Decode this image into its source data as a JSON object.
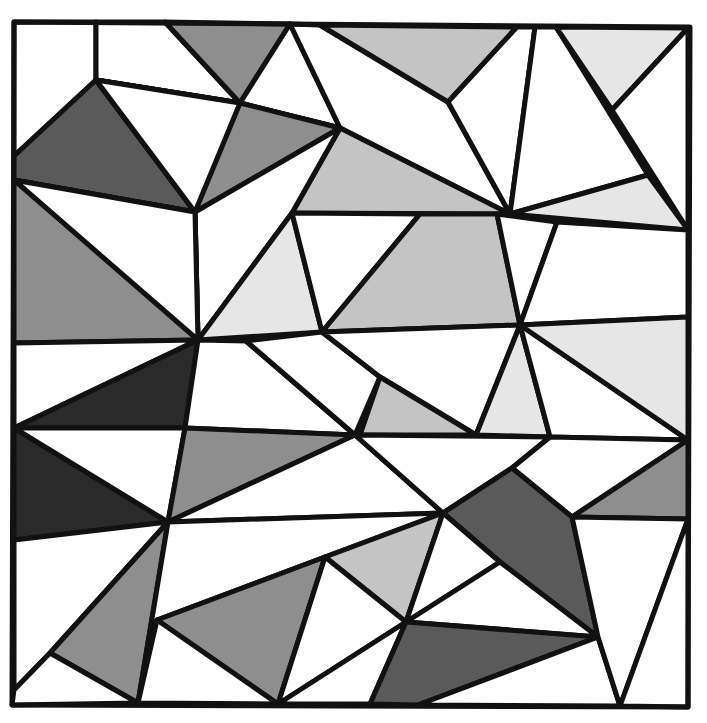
{
  "artwork": {
    "type": "geometric-polygon-mosaic",
    "palette": {
      "white": "#ffffff",
      "light": "#e6e6e6",
      "lightmid": "#c4c4c4",
      "mid": "#8e8e8e",
      "dark": "#5a5a5a",
      "darkest": "#2a2a2a",
      "stroke": "#111111"
    },
    "frame": [
      [
        14,
        22
      ],
      [
        690,
        27
      ],
      [
        688,
        707
      ],
      [
        12,
        705
      ]
    ],
    "polygons": [
      {
        "shade": "white",
        "points": [
          [
            14,
            22
          ],
          [
            96,
            22
          ],
          [
            96,
            80
          ],
          [
            14,
            156
          ]
        ]
      },
      {
        "shade": "white",
        "points": [
          [
            96,
            22
          ],
          [
            165,
            22
          ],
          [
            240,
            103
          ],
          [
            96,
            80
          ]
        ]
      },
      {
        "shade": "mid",
        "points": [
          [
            165,
            22
          ],
          [
            290,
            24
          ],
          [
            240,
            103
          ]
        ]
      },
      {
        "shade": "white",
        "points": [
          [
            290,
            24
          ],
          [
            340,
            128
          ],
          [
            240,
            103
          ]
        ]
      },
      {
        "shade": "white",
        "points": [
          [
            290,
            24
          ],
          [
            320,
            25
          ],
          [
            448,
            102
          ],
          [
            510,
            214
          ],
          [
            340,
            128
          ]
        ]
      },
      {
        "shade": "lightmid",
        "points": [
          [
            320,
            25
          ],
          [
            517,
            27
          ],
          [
            448,
            102
          ]
        ]
      },
      {
        "shade": "white",
        "points": [
          [
            517,
            27
          ],
          [
            535,
            27
          ],
          [
            510,
            214
          ],
          [
            448,
            102
          ]
        ]
      },
      {
        "shade": "white",
        "points": [
          [
            535,
            27
          ],
          [
            556,
            27
          ],
          [
            648,
            175
          ],
          [
            510,
            214
          ]
        ]
      },
      {
        "shade": "light",
        "points": [
          [
            556,
            27
          ],
          [
            688,
            28
          ],
          [
            612,
            110
          ]
        ]
      },
      {
        "shade": "white",
        "points": [
          [
            688,
            28
          ],
          [
            688,
            230
          ],
          [
            612,
            110
          ]
        ]
      },
      {
        "shade": "light",
        "points": [
          [
            648,
            175
          ],
          [
            688,
            230
          ],
          [
            510,
            214
          ]
        ]
      },
      {
        "shade": "dark",
        "points": [
          [
            14,
            156
          ],
          [
            96,
            80
          ],
          [
            195,
            212
          ],
          [
            14,
            180
          ]
        ]
      },
      {
        "shade": "white",
        "points": [
          [
            96,
            80
          ],
          [
            240,
            103
          ],
          [
            195,
            212
          ]
        ]
      },
      {
        "shade": "white",
        "points": [
          [
            96,
            80
          ],
          [
            240,
            103
          ],
          [
            195,
            212
          ]
        ]
      },
      {
        "shade": "white",
        "points": [
          [
            96,
            80
          ],
          [
            240,
            103
          ],
          [
            340,
            128
          ],
          [
            195,
            212
          ]
        ]
      },
      {
        "shade": "mid",
        "points": [
          [
            240,
            103
          ],
          [
            340,
            128
          ],
          [
            195,
            212
          ]
        ]
      },
      {
        "shade": "lightmid",
        "points": [
          [
            340,
            128
          ],
          [
            510,
            214
          ],
          [
            292,
            213
          ]
        ]
      },
      {
        "shade": "white",
        "points": [
          [
            340,
            128
          ],
          [
            292,
            213
          ],
          [
            198,
            340
          ],
          [
            195,
            212
          ]
        ]
      },
      {
        "shade": "mid",
        "points": [
          [
            14,
            180
          ],
          [
            195,
            212
          ],
          [
            198,
            340
          ],
          [
            14,
            343
          ]
        ]
      },
      {
        "shade": "white",
        "points": [
          [
            14,
            180
          ],
          [
            195,
            212
          ],
          [
            198,
            340
          ]
        ]
      },
      {
        "shade": "light",
        "points": [
          [
            292,
            213
          ],
          [
            322,
            332
          ],
          [
            198,
            340
          ]
        ]
      },
      {
        "shade": "white",
        "points": [
          [
            292,
            213
          ],
          [
            420,
            214
          ],
          [
            322,
            332
          ]
        ]
      },
      {
        "shade": "lightmid",
        "points": [
          [
            420,
            214
          ],
          [
            497,
            214
          ],
          [
            520,
            325
          ],
          [
            322,
            332
          ]
        ]
      },
      {
        "shade": "white",
        "points": [
          [
            497,
            214
          ],
          [
            557,
            222
          ],
          [
            520,
            325
          ]
        ]
      },
      {
        "shade": "white",
        "points": [
          [
            557,
            222
          ],
          [
            688,
            230
          ],
          [
            688,
            317
          ],
          [
            520,
            325
          ]
        ]
      },
      {
        "shade": "white",
        "points": [
          [
            14,
            343
          ],
          [
            198,
            340
          ],
          [
            14,
            428
          ]
        ]
      },
      {
        "shade": "darkest",
        "points": [
          [
            198,
            340
          ],
          [
            185,
            428
          ],
          [
            14,
            428
          ]
        ]
      },
      {
        "shade": "white",
        "points": [
          [
            198,
            340
          ],
          [
            246,
            341
          ],
          [
            355,
            435
          ],
          [
            185,
            428
          ]
        ]
      },
      {
        "shade": "white",
        "points": [
          [
            246,
            341
          ],
          [
            322,
            332
          ],
          [
            380,
            377
          ],
          [
            355,
            435
          ]
        ]
      },
      {
        "shade": "white",
        "points": [
          [
            322,
            332
          ],
          [
            520,
            325
          ],
          [
            476,
            435
          ],
          [
            380,
            377
          ]
        ]
      },
      {
        "shade": "lightmid",
        "points": [
          [
            380,
            377
          ],
          [
            476,
            435
          ],
          [
            360,
            435
          ]
        ]
      },
      {
        "shade": "light",
        "points": [
          [
            520,
            325
          ],
          [
            550,
            437
          ],
          [
            476,
            435
          ]
        ]
      },
      {
        "shade": "white",
        "points": [
          [
            520,
            325
          ],
          [
            688,
            440
          ],
          [
            550,
            437
          ]
        ]
      },
      {
        "shade": "light",
        "points": [
          [
            520,
            325
          ],
          [
            688,
            317
          ],
          [
            688,
            440
          ]
        ]
      },
      {
        "shade": "darkest",
        "points": [
          [
            14,
            428
          ],
          [
            168,
            522
          ],
          [
            14,
            540
          ]
        ]
      },
      {
        "shade": "white",
        "points": [
          [
            14,
            428
          ],
          [
            185,
            428
          ],
          [
            168,
            522
          ]
        ]
      },
      {
        "shade": "mid",
        "points": [
          [
            185,
            428
          ],
          [
            355,
            435
          ],
          [
            168,
            522
          ]
        ]
      },
      {
        "shade": "white",
        "points": [
          [
            355,
            435
          ],
          [
            443,
            513
          ],
          [
            168,
            522
          ]
        ]
      },
      {
        "shade": "white",
        "points": [
          [
            355,
            435
          ],
          [
            550,
            437
          ],
          [
            512,
            468
          ],
          [
            443,
            513
          ]
        ]
      },
      {
        "shade": "white",
        "points": [
          [
            550,
            437
          ],
          [
            688,
            440
          ],
          [
            572,
            517
          ],
          [
            512,
            468
          ]
        ]
      },
      {
        "shade": "mid",
        "points": [
          [
            688,
            440
          ],
          [
            688,
            519
          ],
          [
            572,
            517
          ]
        ]
      },
      {
        "shade": "dark",
        "points": [
          [
            443,
            513
          ],
          [
            512,
            468
          ],
          [
            572,
            517
          ],
          [
            598,
            637
          ],
          [
            500,
            562
          ]
        ]
      },
      {
        "shade": "white",
        "points": [
          [
            14,
            540
          ],
          [
            168,
            522
          ],
          [
            50,
            653
          ],
          [
            14,
            690
          ]
        ]
      },
      {
        "shade": "mid",
        "points": [
          [
            168,
            522
          ],
          [
            138,
            703
          ],
          [
            50,
            653
          ]
        ]
      },
      {
        "shade": "white",
        "points": [
          [
            14,
            690
          ],
          [
            50,
            653
          ],
          [
            138,
            703
          ],
          [
            12,
            705
          ]
        ]
      },
      {
        "shade": "white",
        "points": [
          [
            168,
            522
          ],
          [
            443,
            513
          ],
          [
            325,
            557
          ],
          [
            157,
            620
          ],
          [
            138,
            703
          ]
        ]
      },
      {
        "shade": "lightmid",
        "points": [
          [
            325,
            557
          ],
          [
            443,
            513
          ],
          [
            406,
            622
          ]
        ]
      },
      {
        "shade": "mid",
        "points": [
          [
            157,
            620
          ],
          [
            325,
            557
          ],
          [
            278,
            704
          ]
        ]
      },
      {
        "shade": "white",
        "points": [
          [
            157,
            620
          ],
          [
            278,
            704
          ],
          [
            138,
            703
          ]
        ]
      },
      {
        "shade": "white",
        "points": [
          [
            325,
            557
          ],
          [
            406,
            622
          ],
          [
            278,
            704
          ]
        ]
      },
      {
        "shade": "white",
        "points": [
          [
            443,
            513
          ],
          [
            500,
            562
          ],
          [
            406,
            622
          ]
        ]
      },
      {
        "shade": "white",
        "points": [
          [
            500,
            562
          ],
          [
            598,
            637
          ],
          [
            406,
            622
          ]
        ]
      },
      {
        "shade": "white",
        "points": [
          [
            406,
            622
          ],
          [
            370,
            704
          ],
          [
            278,
            704
          ]
        ]
      },
      {
        "shade": "dark",
        "points": [
          [
            406,
            622
          ],
          [
            598,
            637
          ],
          [
            418,
            705
          ],
          [
            370,
            704
          ]
        ]
      },
      {
        "shade": "white",
        "points": [
          [
            598,
            637
          ],
          [
            620,
            706
          ],
          [
            418,
            705
          ]
        ]
      },
      {
        "shade": "white",
        "points": [
          [
            572,
            517
          ],
          [
            688,
            519
          ],
          [
            620,
            706
          ],
          [
            598,
            637
          ]
        ]
      },
      {
        "shade": "white",
        "points": [
          [
            688,
            519
          ],
          [
            688,
            707
          ],
          [
            620,
            706
          ]
        ]
      }
    ]
  }
}
